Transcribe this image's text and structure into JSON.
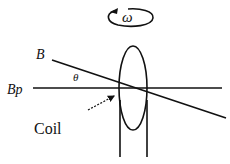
{
  "labels": {
    "omega": "ω",
    "b_field": "B",
    "b_parallel": "Bp",
    "angle": "θ",
    "coil": "Coil"
  },
  "colors": {
    "stroke": "#111111",
    "background": "#ffffff"
  }
}
